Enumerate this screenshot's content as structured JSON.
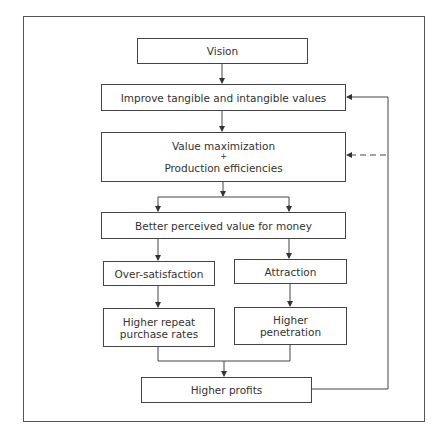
{
  "diagram": {
    "nodes": {
      "vision": {
        "label": "Vision"
      },
      "improve": {
        "label": "Improve tangible and intangible values"
      },
      "value": {
        "line1": "Value maximization",
        "line2": "+",
        "line3": "Production efficiencies"
      },
      "better": {
        "label": "Better perceived value for money"
      },
      "oversat": {
        "label": "Over-satisfaction"
      },
      "attraction": {
        "label": "Attraction"
      },
      "repeat": {
        "line1": "Higher repeat",
        "line2": "purchase rates"
      },
      "penetration": {
        "line1": "Higher",
        "line2": "penetration"
      },
      "profits": {
        "label": "Higher profits"
      }
    },
    "edges": [
      {
        "from": "vision",
        "to": "improve",
        "style": "solid"
      },
      {
        "from": "improve",
        "to": "value",
        "style": "solid"
      },
      {
        "from": "value",
        "to": "better",
        "style": "solid",
        "note": "split into two arrows"
      },
      {
        "from": "better",
        "to": "oversat",
        "style": "solid"
      },
      {
        "from": "better",
        "to": "attraction",
        "style": "solid"
      },
      {
        "from": "oversat",
        "to": "repeat",
        "style": "solid"
      },
      {
        "from": "attraction",
        "to": "penetration",
        "style": "solid"
      },
      {
        "from": "repeat",
        "to": "profits",
        "style": "solid"
      },
      {
        "from": "penetration",
        "to": "profits",
        "style": "solid"
      },
      {
        "from": "profits",
        "to": "improve",
        "style": "solid",
        "note": "feedback loop"
      },
      {
        "from": "profits",
        "to": "value",
        "style": "dashed",
        "note": "feedback loop"
      }
    ],
    "colors": {
      "line": "#444444",
      "text": "#333333",
      "background": "#ffffff"
    }
  }
}
